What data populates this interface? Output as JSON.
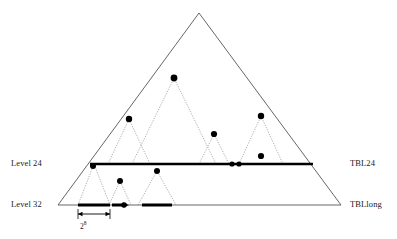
{
  "figure": {
    "type": "diagram",
    "labels": {
      "left_top": "Level 24",
      "left_bottom": "Level 32",
      "right_top": "TBL24",
      "right_bottom": "TBLlong",
      "span_base": "2",
      "span_exponent": "8"
    },
    "colors": {
      "stroke": "#555555",
      "bold_stroke": "#000000",
      "dot": "#000000",
      "background": "#ffffff"
    },
    "geometry": {
      "main_triangle": {
        "apex_x": 199,
        "apex_y": 13,
        "left_x": 58,
        "right_x": 341,
        "base_y": 205
      },
      "level24_line": {
        "y": 164,
        "x1": 90,
        "x2": 313,
        "width": 2.6
      },
      "level32_line": {
        "y": 205,
        "x1": 58,
        "x2": 341,
        "width": 0.9
      }
    },
    "sub_triangles_upper": [
      {
        "apex_x": 129,
        "apex_y": 119,
        "half_width": 21
      },
      {
        "apex_x": 174,
        "apex_y": 78,
        "half_width": 42
      },
      {
        "apex_x": 214,
        "apex_y": 134,
        "half_width": 15
      },
      {
        "apex_x": 261,
        "apex_y": 116,
        "half_width": 22
      }
    ],
    "sub_triangles_lower": [
      {
        "apex_x": 94,
        "apex_y": 164,
        "half_width": 16
      },
      {
        "apex_x": 120,
        "apex_y": 181,
        "half_width": 11
      },
      {
        "apex_x": 157,
        "apex_y": 171,
        "half_width": 19
      }
    ],
    "dots": [
      {
        "x": 129,
        "y": 119,
        "r": 3.2
      },
      {
        "x": 174,
        "y": 78,
        "r": 3.4
      },
      {
        "x": 214,
        "y": 134,
        "r": 3.1
      },
      {
        "x": 261,
        "y": 116,
        "r": 3.2
      },
      {
        "x": 261,
        "y": 156,
        "r": 3.1
      },
      {
        "x": 232,
        "y": 164,
        "r": 2.6
      },
      {
        "x": 239,
        "y": 164,
        "r": 2.6
      },
      {
        "x": 93,
        "y": 166,
        "r": 3.0
      },
      {
        "x": 120,
        "y": 181,
        "r": 3.0
      },
      {
        "x": 157,
        "y": 171,
        "r": 3.0
      },
      {
        "x": 124,
        "y": 205,
        "r": 2.8
      }
    ],
    "bold_segments": [
      {
        "x1": 78,
        "x2": 110,
        "y": 205
      },
      {
        "x1": 112,
        "x2": 126,
        "y": 205
      },
      {
        "x1": 142,
        "x2": 172,
        "y": 205
      }
    ],
    "dimension_arrow": {
      "x1": 78,
      "x2": 110,
      "y": 214,
      "tick_top": 209,
      "tick_bottom": 219
    }
  }
}
